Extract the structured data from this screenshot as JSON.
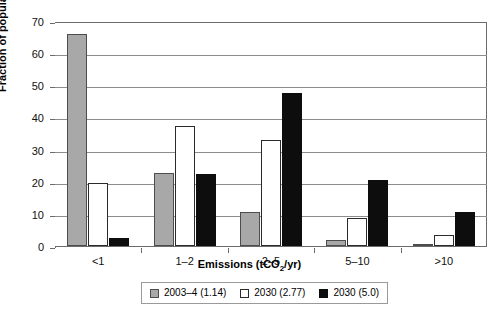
{
  "chart_data": {
    "type": "bar",
    "title": "",
    "xlabel": "Emissions (tCO2/yr)",
    "xlabel_parts": {
      "pre": "Emissions (tCO",
      "sub": "2",
      "post": "/yr)"
    },
    "ylabel": "Fraction of population (%)",
    "categories": [
      "<1",
      "1–2",
      "2–5",
      "5–10",
      ">10"
    ],
    "ylim": [
      0,
      70
    ],
    "yticks": [
      0,
      10,
      20,
      30,
      40,
      50,
      60,
      70
    ],
    "ytick_labels": [
      "0",
      "10",
      "20",
      "30",
      "40",
      "50",
      "60",
      "70"
    ],
    "grid": "horizontal",
    "legend_position": "bottom-center",
    "series": [
      {
        "name": "2003–4 (1.14)",
        "color": "#a8a8a8",
        "values": [
          66.0,
          22.8,
          10.5,
          2.0,
          0.7
        ]
      },
      {
        "name": "2030 (2.77)",
        "color": "#ffffff",
        "values": [
          19.5,
          37.3,
          33.0,
          8.8,
          3.3
        ]
      },
      {
        "name": "2030 (5.0)",
        "color": "#0d0d0d",
        "values": [
          2.5,
          22.3,
          47.5,
          20.5,
          10.5
        ]
      }
    ]
  }
}
